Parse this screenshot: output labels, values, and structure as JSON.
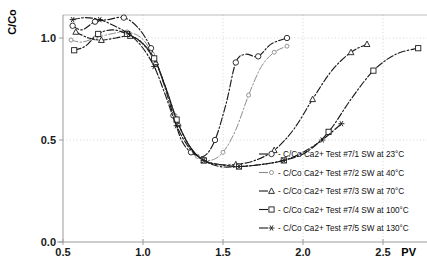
{
  "chart_data": {
    "type": "line",
    "title": "",
    "xlabel": "PV",
    "ylabel": "C/Co",
    "xlim": [
      0.5,
      2.78
    ],
    "ylim": [
      0.0,
      1.17
    ],
    "xticks": [
      0.5,
      1.0,
      1.5,
      2.0,
      2.5
    ],
    "xticklabels": [
      "0.5",
      "1.0",
      "1.5",
      "2.0",
      "2.5"
    ],
    "yticks": [
      0.0,
      0.5,
      1.0
    ],
    "yticklabels": [
      "0.0",
      "0.5",
      "1.0"
    ],
    "grid": "dotted-both",
    "legend_position": "inside-lower-right",
    "series": [
      {
        "name": "- C/Co Ca2+ Test #7/1 SW at 23°C",
        "marker": "circle",
        "style": "dash-dot",
        "tone": "dark",
        "points": [
          [
            0.56,
            1.06
          ],
          [
            0.62,
            1.04
          ],
          [
            0.7,
            1.08
          ],
          [
            0.78,
            1.09
          ],
          [
            0.88,
            1.1
          ],
          [
            0.97,
            1.05
          ],
          [
            1.05,
            0.95
          ],
          [
            1.12,
            0.8
          ],
          [
            1.19,
            0.62
          ],
          [
            1.24,
            0.5
          ],
          [
            1.3,
            0.44
          ],
          [
            1.38,
            0.42
          ],
          [
            1.45,
            0.5
          ],
          [
            1.52,
            0.68
          ],
          [
            1.58,
            0.88
          ],
          [
            1.64,
            0.92
          ],
          [
            1.72,
            0.91
          ],
          [
            1.8,
            0.97
          ],
          [
            1.9,
            1.0
          ]
        ]
      },
      {
        "name": "- C/Co Ca2+ Test #7/2 SW at 40°C",
        "marker": "small-circle",
        "style": "dash-dot",
        "tone": "light",
        "points": [
          [
            0.55,
            0.99
          ],
          [
            0.62,
            0.98
          ],
          [
            0.7,
            1.0
          ],
          [
            0.8,
            1.02
          ],
          [
            0.9,
            1.03
          ],
          [
            0.99,
            1.0
          ],
          [
            1.06,
            0.92
          ],
          [
            1.13,
            0.78
          ],
          [
            1.2,
            0.62
          ],
          [
            1.27,
            0.5
          ],
          [
            1.34,
            0.42
          ],
          [
            1.42,
            0.4
          ],
          [
            1.5,
            0.44
          ],
          [
            1.58,
            0.55
          ],
          [
            1.66,
            0.72
          ],
          [
            1.74,
            0.86
          ],
          [
            1.82,
            0.93
          ],
          [
            1.9,
            0.96
          ]
        ]
      },
      {
        "name": "- C/Co Ca2+ Test #7/3 SW at 70°C",
        "marker": "triangle",
        "style": "dash-dot",
        "tone": "dark",
        "points": [
          [
            0.58,
            1.03
          ],
          [
            0.66,
            1.0
          ],
          [
            0.74,
            0.99
          ],
          [
            0.83,
            1.0
          ],
          [
            0.92,
            1.01
          ],
          [
            1.0,
            0.97
          ],
          [
            1.08,
            0.88
          ],
          [
            1.15,
            0.74
          ],
          [
            1.22,
            0.58
          ],
          [
            1.3,
            0.46
          ],
          [
            1.38,
            0.4
          ],
          [
            1.47,
            0.38
          ],
          [
            1.58,
            0.38
          ],
          [
            1.7,
            0.4
          ],
          [
            1.82,
            0.45
          ],
          [
            1.94,
            0.55
          ],
          [
            2.06,
            0.7
          ],
          [
            2.18,
            0.84
          ],
          [
            2.3,
            0.93
          ],
          [
            2.4,
            0.97
          ]
        ]
      },
      {
        "name": "- C/Co Ca2+ Test #7/4 SW at 100°C",
        "marker": "square",
        "style": "dash-dot",
        "tone": "dark",
        "points": [
          [
            0.57,
            0.94
          ],
          [
            0.64,
            0.96
          ],
          [
            0.72,
            1.02
          ],
          [
            0.81,
            1.04
          ],
          [
            0.9,
            1.02
          ],
          [
            0.99,
            0.98
          ],
          [
            1.07,
            0.9
          ],
          [
            1.14,
            0.76
          ],
          [
            1.21,
            0.6
          ],
          [
            1.29,
            0.47
          ],
          [
            1.38,
            0.4
          ],
          [
            1.48,
            0.37
          ],
          [
            1.6,
            0.37
          ],
          [
            1.74,
            0.38
          ],
          [
            1.88,
            0.4
          ],
          [
            2.02,
            0.44
          ],
          [
            2.16,
            0.54
          ],
          [
            2.3,
            0.7
          ],
          [
            2.44,
            0.84
          ],
          [
            2.58,
            0.92
          ],
          [
            2.72,
            0.95
          ]
        ]
      },
      {
        "name": "- C/Co Ca2+ Test #7/5 SW at 130°C",
        "marker": "asterisk",
        "style": "dash-dot",
        "tone": "dark",
        "points": [
          [
            0.56,
            1.09
          ],
          [
            0.64,
            1.1
          ],
          [
            0.73,
            1.09
          ],
          [
            0.82,
            1.06
          ],
          [
            0.91,
            1.02
          ],
          [
            0.99,
            0.96
          ],
          [
            1.07,
            0.86
          ],
          [
            1.14,
            0.72
          ],
          [
            1.21,
            0.57
          ],
          [
            1.29,
            0.46
          ],
          [
            1.38,
            0.4
          ],
          [
            1.48,
            0.38
          ],
          [
            1.6,
            0.37
          ],
          [
            1.74,
            0.38
          ],
          [
            1.88,
            0.4
          ],
          [
            2.0,
            0.44
          ],
          [
            2.12,
            0.5
          ],
          [
            2.24,
            0.58
          ]
        ]
      }
    ]
  }
}
